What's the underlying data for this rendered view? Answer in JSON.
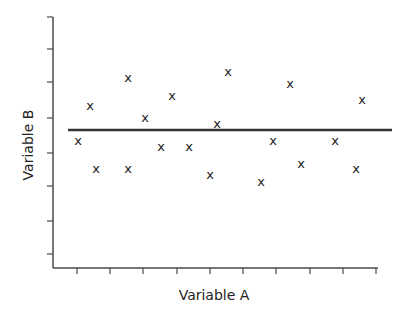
{
  "chart_data": {
    "type": "scatter",
    "title": "",
    "xlabel": "Variable A",
    "ylabel": "Variable B",
    "marker": "x",
    "xlim": [
      0,
      10
    ],
    "ylim": [
      0,
      7.5
    ],
    "x_ticks": 9,
    "y_ticks": 7,
    "tick_labels_shown": false,
    "grid": false,
    "legend": null,
    "reference_line": {
      "type": "horizontal",
      "label": "mean",
      "y": 4.15
    },
    "points": [
      {
        "x": 0.3,
        "y": 3.75
      },
      {
        "x": 0.65,
        "y": 4.8
      },
      {
        "x": 0.85,
        "y": 2.9
      },
      {
        "x": 1.8,
        "y": 5.65
      },
      {
        "x": 1.8,
        "y": 2.9
      },
      {
        "x": 2.3,
        "y": 4.45
      },
      {
        "x": 2.8,
        "y": 3.55
      },
      {
        "x": 3.15,
        "y": 5.1
      },
      {
        "x": 3.65,
        "y": 3.55
      },
      {
        "x": 4.3,
        "y": 2.7
      },
      {
        "x": 4.5,
        "y": 4.25
      },
      {
        "x": 4.85,
        "y": 5.8
      },
      {
        "x": 5.85,
        "y": 2.5
      },
      {
        "x": 6.2,
        "y": 3.75
      },
      {
        "x": 6.7,
        "y": 5.45
      },
      {
        "x": 7.05,
        "y": 3.05
      },
      {
        "x": 8.05,
        "y": 3.75
      },
      {
        "x": 8.7,
        "y": 2.9
      },
      {
        "x": 8.85,
        "y": 4.95
      }
    ]
  },
  "layout": {
    "plot_left": 68,
    "plot_right": 392,
    "plot_top": 17,
    "plot_bottom": 268,
    "x_tick_px": [
      77,
      110,
      143,
      177,
      210,
      243,
      276,
      310,
      343,
      376
    ],
    "y_tick_px": [
      17,
      49,
      82,
      118,
      153,
      186,
      221,
      254
    ],
    "mean_y_px": 130,
    "points_px": [
      [
        78,
        141
      ],
      [
        90,
        106
      ],
      [
        96,
        169
      ],
      [
        128,
        78
      ],
      [
        128,
        169
      ],
      [
        145,
        118
      ],
      [
        161,
        147
      ],
      [
        172,
        96
      ],
      [
        189,
        147
      ],
      [
        210,
        175
      ],
      [
        217,
        124
      ],
      [
        228,
        72
      ],
      [
        261,
        182
      ],
      [
        273,
        141
      ],
      [
        290,
        84
      ],
      [
        301,
        164
      ],
      [
        335,
        141
      ],
      [
        356,
        169
      ],
      [
        362,
        100
      ]
    ]
  },
  "marker_glyph": "x"
}
